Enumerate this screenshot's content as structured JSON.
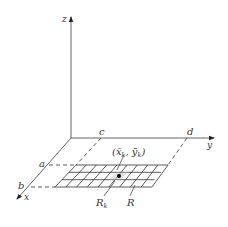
{
  "diagram": {
    "type": "3d-axes-rectangle-partition",
    "axes": {
      "x_label": "x",
      "y_label": "y",
      "z_label": "z"
    },
    "bounds": {
      "a_label": "a",
      "b_label": "b",
      "c_label": "c",
      "d_label": "d"
    },
    "sample_point": {
      "open_paren": "(",
      "x_bar": "x̄",
      "x_sub": "k",
      "comma": ", ",
      "y_bar": "ȳ",
      "y_sub": "k",
      "close_paren": ")"
    },
    "subrectangle_label": {
      "main": "R",
      "sub": "k"
    },
    "region_label": "R",
    "grid": {
      "rows": 3,
      "columns": 9
    },
    "colors": {
      "line": "#333333",
      "axis": "#555555",
      "point": "#000000"
    }
  }
}
